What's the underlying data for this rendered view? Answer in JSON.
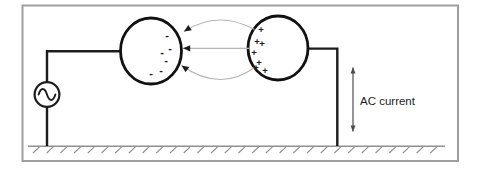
{
  "labels": {
    "ac_current": "AC current"
  },
  "colors": {
    "frame": "#9e9e9e",
    "wire": "#1c1c1c",
    "sphere": "#111111",
    "field_line": "#b5b5b5",
    "arrowhead": "#1c1c1c",
    "ground": "#8f8f8f",
    "dim": "#4d4d4d",
    "text": "#1c1c1c",
    "background": "#ffffff"
  },
  "charges": {
    "negative": {
      "glyph": "-",
      "points": [
        [
          167,
          35
        ],
        [
          170,
          48
        ],
        [
          162,
          52
        ],
        [
          166,
          60
        ],
        [
          161,
          70
        ],
        [
          151,
          73
        ]
      ]
    },
    "positive": {
      "glyph": "+",
      "points": [
        [
          261,
          29
        ],
        [
          257,
          41
        ],
        [
          262,
          43
        ],
        [
          254,
          52
        ],
        [
          259,
          62
        ],
        [
          256,
          67
        ],
        [
          265,
          70
        ]
      ]
    }
  },
  "icons": {
    "source": "ac-source-sine-icon",
    "field_arrows": "field-line-arrowhead-icon",
    "dimension_arrow": "double-headed-arrow-icon"
  }
}
